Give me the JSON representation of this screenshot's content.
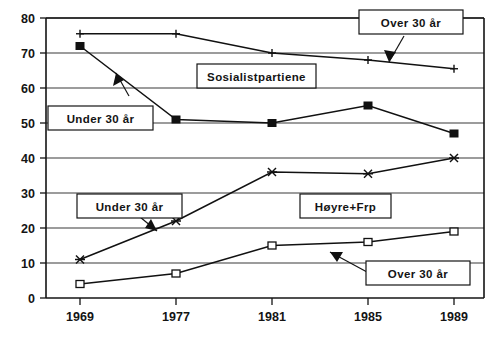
{
  "chart_data": {
    "type": "line",
    "title": "",
    "subtitle": "",
    "xlabel": "",
    "ylabel": "",
    "x": [
      1969,
      1977,
      1981,
      1985,
      1989
    ],
    "categories": [
      "1969",
      "1977",
      "1981",
      "1985",
      "1989"
    ],
    "ylim": [
      0,
      80
    ],
    "yticks": [
      0,
      10,
      20,
      30,
      40,
      50,
      60,
      70,
      80
    ],
    "ytick_labels": [
      "0",
      "10",
      "20",
      "30",
      "40",
      "50",
      "60",
      "70",
      "80"
    ],
    "grid": true,
    "grid_axis": "y",
    "legend": "none",
    "legend_position": "annotations",
    "series": [
      {
        "name": "Sosialistpartiene Over 30 år",
        "marker": "plus",
        "values": [
          75.5,
          75.5,
          70,
          68,
          65.5
        ]
      },
      {
        "name": "Sosialistpartiene Under 30 år",
        "marker": "filled-square",
        "values": [
          72,
          51,
          50,
          55,
          47
        ]
      },
      {
        "name": "Høyre+Frp Under 30 år",
        "marker": "x",
        "values": [
          11,
          22,
          36,
          35.5,
          40
        ]
      },
      {
        "name": "Høyre+Frp Over 30 år",
        "marker": "open-square",
        "values": [
          4,
          7,
          15,
          16,
          19
        ]
      }
    ],
    "annotations": [
      {
        "id": "annotation-over-30-top",
        "text": "Over 30 år",
        "points_to_series": "Sosialistpartiene Over 30 år"
      },
      {
        "id": "annotation-sosialistpartiene",
        "text": "Sosialistpartiene",
        "points_to_series": "Sosialistpartiene"
      },
      {
        "id": "annotation-under-30-top",
        "text": "Under 30 år",
        "points_to_series": "Sosialistpartiene Under 30 år"
      },
      {
        "id": "annotation-under-30-bottom",
        "text": "Under 30 år",
        "points_to_series": "Høyre+Frp Under 30 år"
      },
      {
        "id": "annotation-hoyre-frp",
        "text": "Høyre+Frp",
        "points_to_series": "Høyre+Frp"
      },
      {
        "id": "annotation-over-30-bottom",
        "text": "Over 30 år",
        "points_to_series": "Høyre+Frp Over 30 år"
      }
    ],
    "colors": {
      "line": "#111111",
      "grid": "#3a3a3a",
      "axis": "#141414",
      "background": "#ffffff"
    }
  },
  "axis": {
    "y_labels": [
      "80",
      "70",
      "60",
      "50",
      "40",
      "30",
      "20",
      "10",
      "0"
    ],
    "x_labels": [
      "1969",
      "1977",
      "1981",
      "1985",
      "1989"
    ]
  },
  "annotations": {
    "over_30_top": "Over 30 år",
    "sosialistpartiene": "Sosialistpartiene",
    "under_30_top": "Under 30 år",
    "under_30_bottom": "Under 30 år",
    "hoyre_frp": "Høyre+Frp",
    "over_30_bottom": "Over 30 år"
  }
}
